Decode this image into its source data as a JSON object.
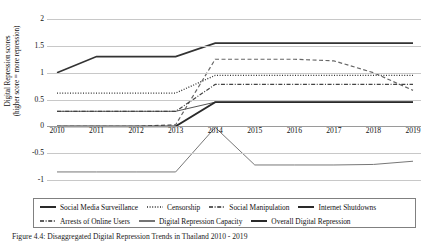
{
  "chart_data": {
    "type": "line",
    "title": "",
    "xlabel": "",
    "ylabel_line1": "Digital Repression scores",
    "ylabel_line2": "(higher score = more repression)",
    "categories": [
      "2010",
      "2011",
      "2012",
      "2013",
      "2014",
      "2015",
      "2016",
      "2017",
      "2018",
      "2019"
    ],
    "x": [
      2010,
      2011,
      2012,
      2013,
      2014,
      2015,
      2016,
      2017,
      2018,
      2019
    ],
    "ylim": [
      -1,
      2
    ],
    "yticks": [
      2,
      1.5,
      1,
      0.5,
      0,
      -0.5,
      -1
    ],
    "ytick_labels": [
      "2",
      "1.5",
      "1",
      "0.5",
      "0",
      "-0.5",
      "-1"
    ],
    "grid": true,
    "legend_position": "bottom",
    "series": [
      {
        "name": "Social Media Surveillance",
        "style": "solid-thin",
        "color": "#555555",
        "values": [
          0.28,
          0.28,
          0.28,
          0.28,
          0.45,
          0.45,
          0.45,
          0.45,
          0.45,
          0.45
        ]
      },
      {
        "name": "Censorship",
        "style": "dotted",
        "color": "#333333",
        "values": [
          0.62,
          0.62,
          0.62,
          0.62,
          0.95,
          0.95,
          0.95,
          0.95,
          0.95,
          0.95
        ]
      },
      {
        "name": "Social Manipulation",
        "style": "dashed",
        "color": "#666666",
        "values": [
          0.0,
          0.0,
          0.0,
          0.03,
          1.25,
          1.25,
          1.25,
          1.22,
          1.0,
          0.67
        ]
      },
      {
        "name": "Internet Shutdowns",
        "style": "solid-thick",
        "color": "#333333",
        "values": [
          1.0,
          1.3,
          1.3,
          1.3,
          1.55,
          1.55,
          1.55,
          1.55,
          1.55,
          1.55
        ]
      },
      {
        "name": "Arrests of Online Users",
        "style": "dash-dot",
        "color": "#444444",
        "values": [
          0.28,
          0.28,
          0.28,
          0.28,
          0.78,
          0.78,
          0.78,
          0.78,
          0.78,
          0.78
        ]
      },
      {
        "name": "Digital Repression Capacity",
        "style": "solid-thin",
        "color": "#777777",
        "values": [
          -0.85,
          -0.85,
          -0.85,
          -0.85,
          -0.02,
          -0.72,
          -0.72,
          -0.72,
          -0.71,
          -0.65
        ]
      },
      {
        "name": "Overall Digital Repression",
        "style": "solid-thick",
        "color": "#2a2a2a",
        "values": [
          0.0,
          0.0,
          0.0,
          0.0,
          0.45,
          0.45,
          0.45,
          0.45,
          0.45,
          0.45
        ]
      }
    ]
  },
  "legend": {
    "row1": [
      {
        "label": "Social Media Surveillance",
        "style": "solid-thick"
      },
      {
        "label": "Censorship",
        "style": "dotted"
      },
      {
        "label": "Social Manipulation",
        "style": "dash-dot"
      },
      {
        "label": "Internet Shutdowns",
        "style": "solid-thick"
      }
    ],
    "row2": [
      {
        "label": "Arrests of Online Users",
        "style": "dash-dot"
      },
      {
        "label": "Digital Repression Capacity",
        "style": "solid-thin"
      },
      {
        "label": "Overall Digital Repression",
        "style": "solid-thick"
      }
    ]
  },
  "caption": {
    "text": "Figure 4.4: Disaggregated Digital Repression Trends in Thailand 2010 - 2019"
  }
}
